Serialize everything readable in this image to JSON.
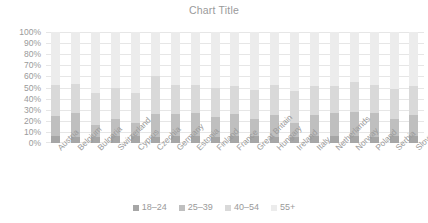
{
  "chart": {
    "title": "Chart Title"
  },
  "legend": {
    "position": "bottom",
    "items": [
      {
        "label": "18–24",
        "color": "#a6a6a6"
      },
      {
        "label": "25–39",
        "color": "#bfbfbf"
      },
      {
        "label": "40–54",
        "color": "#d9d9d9"
      },
      {
        "label": "55+",
        "color": "#ececec"
      }
    ]
  },
  "y_axis": {
    "ticks": [
      "0%",
      "10%",
      "20%",
      "30%",
      "40%",
      "50%",
      "60%",
      "70%",
      "80%",
      "90%",
      "100%"
    ]
  },
  "chart_data": {
    "type": "bar",
    "stacked": true,
    "title": "Chart Title",
    "xlabel": "",
    "ylabel": "",
    "ylim": [
      0,
      100
    ],
    "ytick_format": "percent",
    "grid": true,
    "legend_position": "bottom",
    "categories": [
      "Austria",
      "Belgium",
      "Bulgaria",
      "Switzerland",
      "Cyprus",
      "Czechia",
      "Germany",
      "Estonia",
      "Finland",
      "France",
      "Great Britain",
      "Hungary",
      "Ireland",
      "Italy",
      "Netherlands",
      "Norway",
      "Poland",
      "Serbia",
      "Slovenia"
    ],
    "series": [
      {
        "name": "18–24",
        "color": "#a6a6a6",
        "values": [
          6,
          5,
          5,
          6,
          6,
          5,
          6,
          6,
          5,
          6,
          6,
          5,
          5,
          6,
          6,
          6,
          5,
          6,
          6
        ]
      },
      {
        "name": "25–39",
        "color": "#bfbfbf",
        "values": [
          18,
          22,
          11,
          16,
          12,
          21,
          20,
          21,
          18,
          20,
          16,
          20,
          13,
          19,
          21,
          22,
          22,
          16,
          19
        ]
      },
      {
        "name": "40–54",
        "color": "#d9d9d9",
        "values": [
          28,
          26,
          29,
          28,
          27,
          34,
          26,
          25,
          27,
          25,
          26,
          27,
          29,
          26,
          24,
          27,
          25,
          27,
          26
        ]
      },
      {
        "name": "55+",
        "color": "#ececec",
        "values": [
          48,
          47,
          55,
          50,
          55,
          40,
          48,
          48,
          50,
          49,
          52,
          48,
          53,
          49,
          49,
          45,
          48,
          51,
          49
        ]
      }
    ]
  }
}
